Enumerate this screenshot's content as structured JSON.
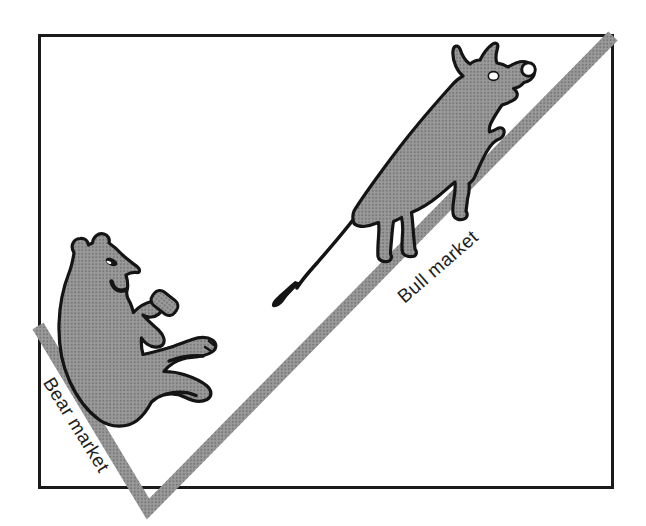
{
  "figure": {
    "labels": {
      "bear": "Bear market",
      "bull": "Bull market"
    },
    "illustrations": [
      "bear sliding down falling slope",
      "bull climbing rising slope"
    ],
    "colors": {
      "background": "#ffffff",
      "frame_border": "#1a1a1a",
      "ink_outline": "#141414",
      "gray_base": "#9a9a9a",
      "gray_dot": "#777777",
      "label_text": "#1f1f1f",
      "eye_white": "#ffffff"
    }
  }
}
